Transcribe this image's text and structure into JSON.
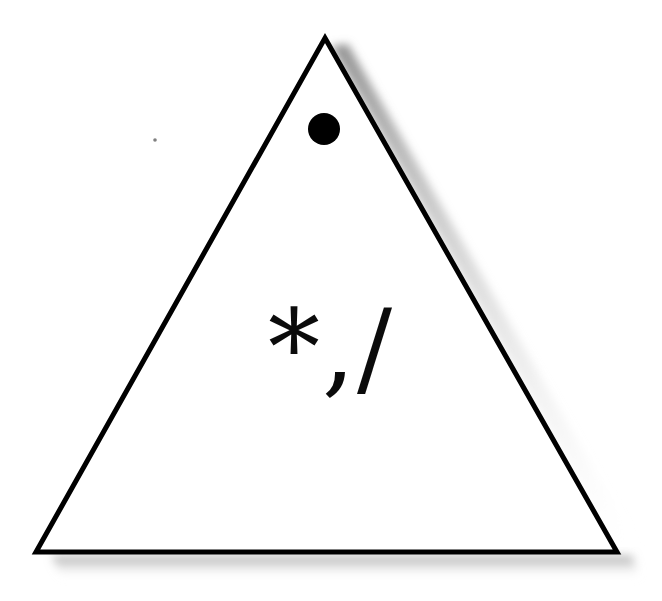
{
  "figure": {
    "background_color": "#ffffff",
    "width": 662,
    "height": 601,
    "shapes": [
      {
        "name": "triangle",
        "type": "triangle",
        "fill": "none",
        "stroke_color": "#000000",
        "stroke_width": 5,
        "apex": [
          325,
          38
        ],
        "bottom_left": [
          36,
          552
        ],
        "bottom_right": [
          617,
          552
        ],
        "has_drop_shadow": true,
        "shadow_color": "#b8b8b8"
      },
      {
        "name": "dot",
        "type": "circle",
        "fill": "#000000",
        "center": [
          324,
          129
        ],
        "radius": 16
      },
      {
        "name": "speck",
        "type": "dust-speck",
        "fill": "#555555",
        "center": [
          155,
          140
        ],
        "radius": 2
      }
    ],
    "glyphs": {
      "text": "*,/",
      "color": "#0b0b0b",
      "characters": [
        {
          "name": "asterisk-glyph",
          "char": "*"
        },
        {
          "name": "comma-glyph",
          "char": ","
        },
        {
          "name": "slash-glyph",
          "char": "/"
        }
      ]
    }
  }
}
